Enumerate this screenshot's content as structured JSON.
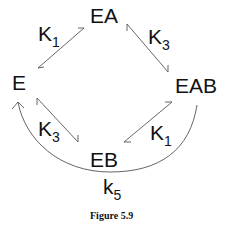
{
  "diagram": {
    "nodes": {
      "E": "E",
      "EA": "EA",
      "EAB": "EAB",
      "EB": "EB"
    },
    "edges": [
      {
        "from": "E",
        "to": "EA",
        "label_main": "K",
        "label_sub": "1",
        "type": "equilibrium"
      },
      {
        "from": "EA",
        "to": "EAB",
        "label_main": "K",
        "label_sub": "3",
        "type": "equilibrium"
      },
      {
        "from": "E",
        "to": "EB",
        "label_main": "K",
        "label_sub": "3",
        "type": "equilibrium"
      },
      {
        "from": "EB",
        "to": "EAB",
        "label_main": "K",
        "label_sub": "1",
        "type": "equilibrium"
      },
      {
        "from": "EAB",
        "to": "E",
        "label_main": "k",
        "label_sub": "5",
        "type": "irreversible-arc"
      }
    ],
    "labels": {
      "k1_top": {
        "main": "K",
        "sub": "1"
      },
      "k3_top": {
        "main": "K",
        "sub": "3"
      },
      "k3_bottom": {
        "main": "K",
        "sub": "3"
      },
      "k1_bottom": {
        "main": "K",
        "sub": "1"
      },
      "k5": {
        "main": "k",
        "sub": "5"
      }
    },
    "caption": "Figure 5.9",
    "line_color": "#555555"
  }
}
